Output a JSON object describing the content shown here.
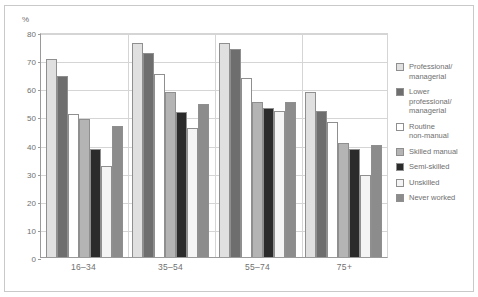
{
  "chart_data": {
    "type": "bar",
    "title": "",
    "subtitle": "",
    "unit_label": "%",
    "xlabel": "",
    "ylabel": "%",
    "ylim": [
      0,
      80
    ],
    "yticks": [
      0,
      10,
      20,
      30,
      40,
      50,
      60,
      70,
      80
    ],
    "ytick_labels": [
      "0",
      "10",
      "20",
      "30",
      "40",
      "50",
      "60",
      "70",
      "80"
    ],
    "grid": true,
    "legend_position": "right",
    "categories": [
      "16–34",
      "35–54",
      "55–74",
      "75+"
    ],
    "series": [
      {
        "name": "Professional/\nmanagerial",
        "color": "#e0e0e0",
        "values": [
          70.5,
          76.0,
          76.0,
          58.5
        ]
      },
      {
        "name": "Lower\nprofessional/\nmanagerial",
        "color": "#6e6e6e",
        "values": [
          64.5,
          72.5,
          74.0,
          52.0
        ]
      },
      {
        "name": "Routine\nnon-manual",
        "color": "#ffffff",
        "values": [
          51.0,
          65.0,
          63.5,
          48.0
        ]
      },
      {
        "name": "Skilled manual",
        "color": "#b4b4b4",
        "values": [
          49.0,
          58.5,
          55.0,
          40.5
        ]
      },
      {
        "name": "Semi-skilled",
        "color": "#2b2b2b",
        "values": [
          38.5,
          51.5,
          53.0,
          38.5
        ]
      },
      {
        "name": "Unskilled",
        "color": "#f4f4f4",
        "values": [
          32.5,
          46.0,
          52.0,
          29.0
        ]
      },
      {
        "name": "Never worked",
        "color": "#8c8c8c",
        "values": [
          46.5,
          54.5,
          55.0,
          40.0
        ]
      }
    ]
  },
  "legend": {
    "items": [
      {
        "label": "Professional/\nmanagerial",
        "swatch": "#e0e0e0"
      },
      {
        "label": "Lower\nprofessional/\nmanagerial",
        "swatch": "#6e6e6e"
      },
      {
        "label": "Routine\nnon-manual",
        "swatch": "#ffffff"
      },
      {
        "label": "Skilled manual",
        "swatch": "#b4b4b4"
      },
      {
        "label": "Semi-skilled",
        "swatch": "#2b2b2b"
      },
      {
        "label": "Unskilled",
        "swatch": "#f4f4f4"
      },
      {
        "label": "Never worked",
        "swatch": "#8c8c8c"
      }
    ]
  },
  "colors": {
    "frame": "#c9c9c9",
    "axis": "#9a9a9a",
    "gridline": "#d5d5d5",
    "text": "#6f6f6f",
    "background": "#ffffff"
  }
}
